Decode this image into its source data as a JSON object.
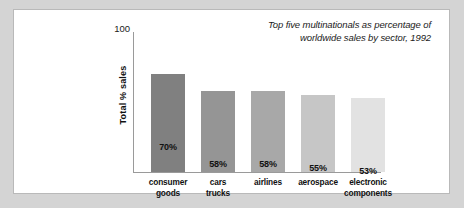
{
  "chart_data": {
    "type": "bar",
    "title": "Top five multinationals as percentage of worldwide sales by sector, 1992",
    "title_lines": [
      "Top five multinationals as percentage of",
      "worldwide sales by sector, 1992"
    ],
    "xlabel": "",
    "ylabel": "Total % sales",
    "ylim": [
      0,
      100
    ],
    "ytick_labels": [
      "100"
    ],
    "grid": false,
    "legend": "none",
    "categories": [
      "consumer goods",
      "cars trucks",
      "airlines",
      "aerospace",
      "electronic components"
    ],
    "category_lines": [
      [
        "consumer",
        "goods"
      ],
      [
        "cars",
        "trucks"
      ],
      [
        "airlines"
      ],
      [
        "aerospace"
      ],
      [
        "electronic",
        "components"
      ]
    ],
    "values": [
      70,
      58,
      58,
      55,
      53
    ],
    "value_labels": [
      "70%",
      "58%",
      "58%",
      "55%",
      "53%"
    ],
    "bar_colors": [
      "#808080",
      "#959595",
      "#a8a8a8",
      "#c6c6c6",
      "#e2e2e2"
    ]
  },
  "colors": {
    "page_background": "#d4d4d4",
    "card_background": "#ffffff",
    "card_border": "#b9b9b9",
    "axis": "#9a9a9a",
    "text": "#111111"
  }
}
